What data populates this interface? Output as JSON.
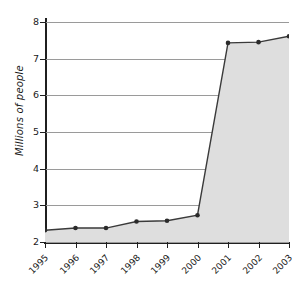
{
  "chart": {
    "ylabel": "Millions of people",
    "xlabel": "",
    "title": ""
  },
  "colors": {
    "fill": "#dedede",
    "line": "#3a3a3a",
    "marker": "#2b2b2b",
    "grid": "#9a9a9a",
    "axis": "#1f1f1f",
    "background": "#ffffff"
  },
  "yticks": [
    "2",
    "3",
    "4",
    "5",
    "6",
    "7",
    "8"
  ],
  "xticks": [
    "1995",
    "1996",
    "1997",
    "1998",
    "1999",
    "2000",
    "2001",
    "2002",
    "2003"
  ],
  "chart_data": {
    "type": "area",
    "title": "",
    "xlabel": "",
    "ylabel": "Millions of people",
    "categories": [
      "1995",
      "1996",
      "1997",
      "1998",
      "1999",
      "2000",
      "2001",
      "2002",
      "2003"
    ],
    "values": [
      2.32,
      2.38,
      2.38,
      2.56,
      2.58,
      2.73,
      7.43,
      7.45,
      7.61
    ],
    "ylim": [
      2,
      8
    ],
    "ytick_values": [
      2,
      3,
      4,
      5,
      6,
      7,
      8
    ],
    "grid": true,
    "legend": false,
    "markers": true,
    "fill_to_baseline": 2
  }
}
